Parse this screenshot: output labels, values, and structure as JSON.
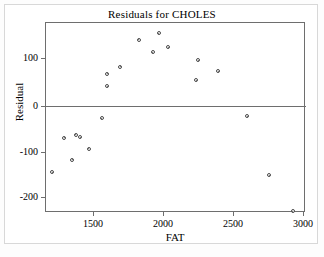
{
  "chart_data": {
    "type": "scatter",
    "title": "Residuals for CHOLES",
    "xlabel": "FAT",
    "ylabel": "Residual",
    "xlim": [
      1114,
      3043
    ],
    "ylim": [
      -240,
      178
    ],
    "grid": false,
    "legend": null,
    "reference_line": {
      "axis": "y",
      "value": 0
    },
    "xticks": [
      1500,
      2000,
      2500,
      3000
    ],
    "xticklabels": [
      "1500",
      "2000",
      "2500",
      "3000"
    ],
    "yticks": [
      100,
      0,
      -100,
      -200
    ],
    "yticklabels": [
      "100",
      "0",
      "-100",
      "-200"
    ],
    "marker": "open-circle",
    "points": [
      {
        "x": 1200,
        "y": -143
      },
      {
        "x": 1286,
        "y": -68
      },
      {
        "x": 1343,
        "y": -116
      },
      {
        "x": 1371,
        "y": -61
      },
      {
        "x": 1400,
        "y": -66
      },
      {
        "x": 1464,
        "y": -92
      },
      {
        "x": 1557,
        "y": -25
      },
      {
        "x": 1593,
        "y": 46
      },
      {
        "x": 1593,
        "y": 73
      },
      {
        "x": 1686,
        "y": 88
      },
      {
        "x": 1821,
        "y": 148
      },
      {
        "x": 1921,
        "y": 120
      },
      {
        "x": 1964,
        "y": 162
      },
      {
        "x": 2029,
        "y": 131
      },
      {
        "x": 2229,
        "y": 59
      },
      {
        "x": 2243,
        "y": 103
      },
      {
        "x": 2386,
        "y": 79
      },
      {
        "x": 2593,
        "y": -20
      },
      {
        "x": 2750,
        "y": -150
      },
      {
        "x": 2921,
        "y": -229
      }
    ]
  },
  "colors": {
    "frame": "#6e6e6e",
    "marker_edge": "#4a4a4a",
    "background": "#ffffff",
    "text": "#000000"
  }
}
